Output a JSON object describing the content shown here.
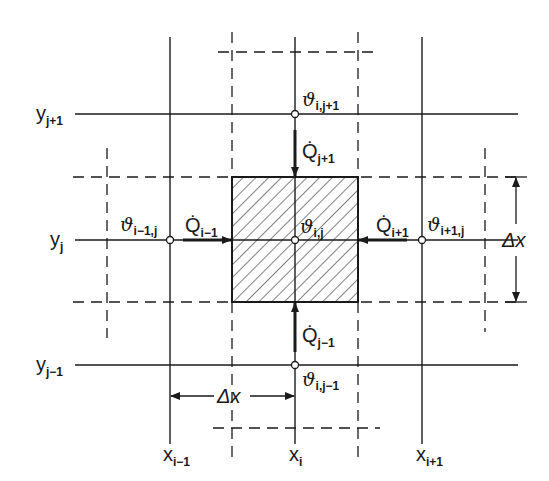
{
  "diagram": {
    "colors": {
      "line": "#1a1a1a",
      "background": "#ffffff",
      "hatch": "#1a1a1a"
    },
    "grid_x_labels": [
      {
        "base": "x",
        "sub": "i−1"
      },
      {
        "base": "x",
        "sub": "i"
      },
      {
        "base": "x",
        "sub": "i+1"
      }
    ],
    "grid_y_labels": [
      {
        "base": "y",
        "sub": "j+1"
      },
      {
        "base": "y",
        "sub": "j"
      },
      {
        "base": "y",
        "sub": "j−1"
      }
    ],
    "nodes": [
      {
        "id": "center",
        "base": "ϑ",
        "sub": "i,j"
      },
      {
        "id": "top",
        "base": "ϑ",
        "sub": "i,j+1"
      },
      {
        "id": "bottom",
        "base": "ϑ",
        "sub": "i,j−1"
      },
      {
        "id": "left",
        "base": "ϑ",
        "sub": "i−1,j"
      },
      {
        "id": "right",
        "base": "ϑ",
        "sub": "i+1,j"
      }
    ],
    "heat_flows": [
      {
        "id": "from-top",
        "base": "Q̇",
        "sub": "j+1"
      },
      {
        "id": "from-bottom",
        "base": "Q̇",
        "sub": "j−1"
      },
      {
        "id": "from-left",
        "base": "Q̇",
        "sub": "i−1"
      },
      {
        "id": "from-right",
        "base": "Q̇",
        "sub": "i+1"
      }
    ],
    "dimensions": [
      {
        "id": "horizontal-spacing",
        "label": "Δx"
      },
      {
        "id": "vertical-spacing",
        "label": "Δx"
      }
    ]
  }
}
